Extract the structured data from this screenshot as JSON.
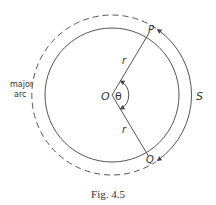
{
  "figure": {
    "caption": "Fig. 4.5",
    "labels": {
      "center": "O",
      "point_p": "P",
      "point_q": "Q",
      "radius_upper": "r",
      "radius_lower": "r",
      "angle": "θ",
      "arc_length": "S",
      "major_arc_line1": "major",
      "major_arc_line2": "arc"
    },
    "colors": {
      "stroke": "#555555",
      "text": "#333333",
      "background": "#ffffff"
    }
  }
}
